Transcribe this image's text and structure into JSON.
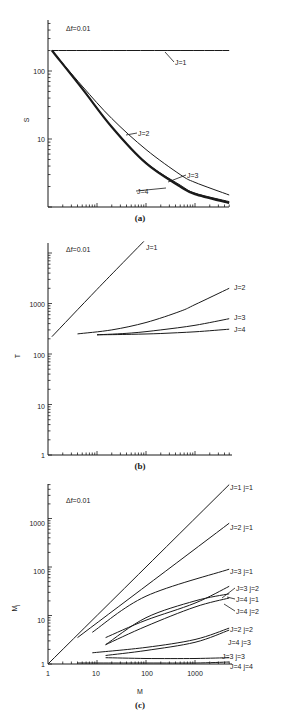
{
  "figure": {
    "panels": [
      {
        "id": "a",
        "caption": "(a)",
        "annotation": "Δf=0.01",
        "ylabel": "S",
        "yticks": [
          "100",
          "10"
        ]
      },
      {
        "id": "b",
        "caption": "(b)",
        "annotation": "Δf=0.01",
        "ylabel": "T",
        "yticks": [
          "1000",
          "100",
          "10",
          "1"
        ]
      },
      {
        "id": "c",
        "caption": "(c)",
        "annotation": "Δf=0.01",
        "ylabel": "M",
        "ylabel_sub": "j",
        "xlabel": "M",
        "yticks": [
          "1000",
          "100",
          "10",
          "1"
        ],
        "xticks": [
          "1",
          "10",
          "100",
          "1000"
        ]
      }
    ]
  },
  "chart_data": [
    {
      "type": "line",
      "title": "(a)",
      "annotation": "Δf=0.01",
      "xlabel": "M",
      "ylabel": "S",
      "xscale": "log",
      "yscale": "log",
      "xlim": [
        1,
        5000
      ],
      "ylim": [
        1,
        560
      ],
      "ytick_labels": [
        "100",
        "10"
      ],
      "grid": false,
      "series": [
        {
          "name": "J=1",
          "x": [
            1.2,
            5000
          ],
          "y": [
            200,
            200
          ]
        },
        {
          "name": "J=2",
          "x": [
            1.2,
            5,
            20,
            100,
            500,
            1000,
            5000
          ],
          "y": [
            200,
            60,
            20,
            7,
            3,
            2.3,
            1.5
          ]
        },
        {
          "name": "J=3",
          "x": [
            1.2,
            5,
            20,
            100,
            500,
            1000,
            5000
          ],
          "y": [
            200,
            55,
            15,
            4.5,
            2.1,
            1.6,
            1.2
          ]
        },
        {
          "name": "J=4",
          "x": [
            1.2,
            5,
            20,
            100,
            500,
            1000,
            5000
          ],
          "y": [
            200,
            55,
            15,
            4.4,
            2.0,
            1.55,
            1.15
          ]
        }
      ]
    },
    {
      "type": "line",
      "title": "(b)",
      "annotation": "Δf=0.01",
      "xlabel": "M",
      "ylabel": "T",
      "xscale": "log",
      "yscale": "log",
      "xlim": [
        1,
        5000
      ],
      "ylim": [
        1,
        15000
      ],
      "ytick_labels": [
        "1000",
        "100",
        "10",
        "1"
      ],
      "grid": false,
      "series": [
        {
          "name": "J=1",
          "x": [
            1.2,
            10,
            90
          ],
          "y": [
            220,
            1900,
            17000
          ]
        },
        {
          "name": "J=2",
          "x": [
            4,
            20,
            100,
            500,
            1000,
            5000
          ],
          "y": [
            250,
            300,
            420,
            700,
            950,
            2000
          ]
        },
        {
          "name": "J=3",
          "x": [
            10,
            50,
            200,
            1000,
            5000
          ],
          "y": [
            240,
            260,
            300,
            370,
            500
          ]
        },
        {
          "name": "J=4",
          "x": [
            10,
            50,
            200,
            1000,
            5000
          ],
          "y": [
            240,
            245,
            255,
            275,
            310
          ]
        }
      ]
    },
    {
      "type": "line",
      "title": "(c)",
      "annotation": "Δf=0.01",
      "xlabel": "M",
      "ylabel": "Mj",
      "xscale": "log",
      "yscale": "log",
      "xlim": [
        1,
        5000
      ],
      "ylim": [
        1,
        7000
      ],
      "xtick_labels": [
        "1",
        "10",
        "100",
        "1000"
      ],
      "ytick_labels": [
        "1000",
        "100",
        "10",
        "1"
      ],
      "grid": false,
      "series": [
        {
          "name": "J=1 j=1",
          "x": [
            1,
            5000
          ],
          "y": [
            1,
            5000
          ]
        },
        {
          "name": "J=2 j=1",
          "x": [
            4,
            5000
          ],
          "y": [
            3.5,
            800
          ]
        },
        {
          "name": "J=3 j=1",
          "x": [
            8,
            100,
            5000
          ],
          "y": [
            4.5,
            25,
            90
          ]
        },
        {
          "name": "J=3 j=2",
          "x": [
            15,
            100,
            1000,
            5000
          ],
          "y": [
            3.5,
            8,
            18,
            40
          ]
        },
        {
          "name": "J=4 j=1",
          "x": [
            15,
            100,
            1000,
            5000
          ],
          "y": [
            2.5,
            9,
            20,
            28
          ]
        },
        {
          "name": "J=4 j=2",
          "x": [
            15,
            100,
            1000,
            5000
          ],
          "y": [
            2.5,
            6,
            15,
            23
          ]
        },
        {
          "name": "J=2 j=2",
          "x": [
            8,
            100,
            1000,
            5000
          ],
          "y": [
            1.7,
            2.2,
            3.2,
            5.5
          ]
        },
        {
          "name": "J=4 j=3",
          "x": [
            15,
            100,
            1000,
            5000
          ],
          "y": [
            1.5,
            1.9,
            2.8,
            5.0
          ]
        },
        {
          "name": "J=3 j=3",
          "x": [
            15,
            100,
            1000,
            5000
          ],
          "y": [
            1.35,
            1.3,
            1.3,
            1.35
          ]
        },
        {
          "name": "J=4 j=4",
          "x": [
            4,
            100,
            1000,
            5000
          ],
          "y": [
            1.05,
            1.05,
            1.05,
            1.1
          ]
        }
      ]
    }
  ]
}
